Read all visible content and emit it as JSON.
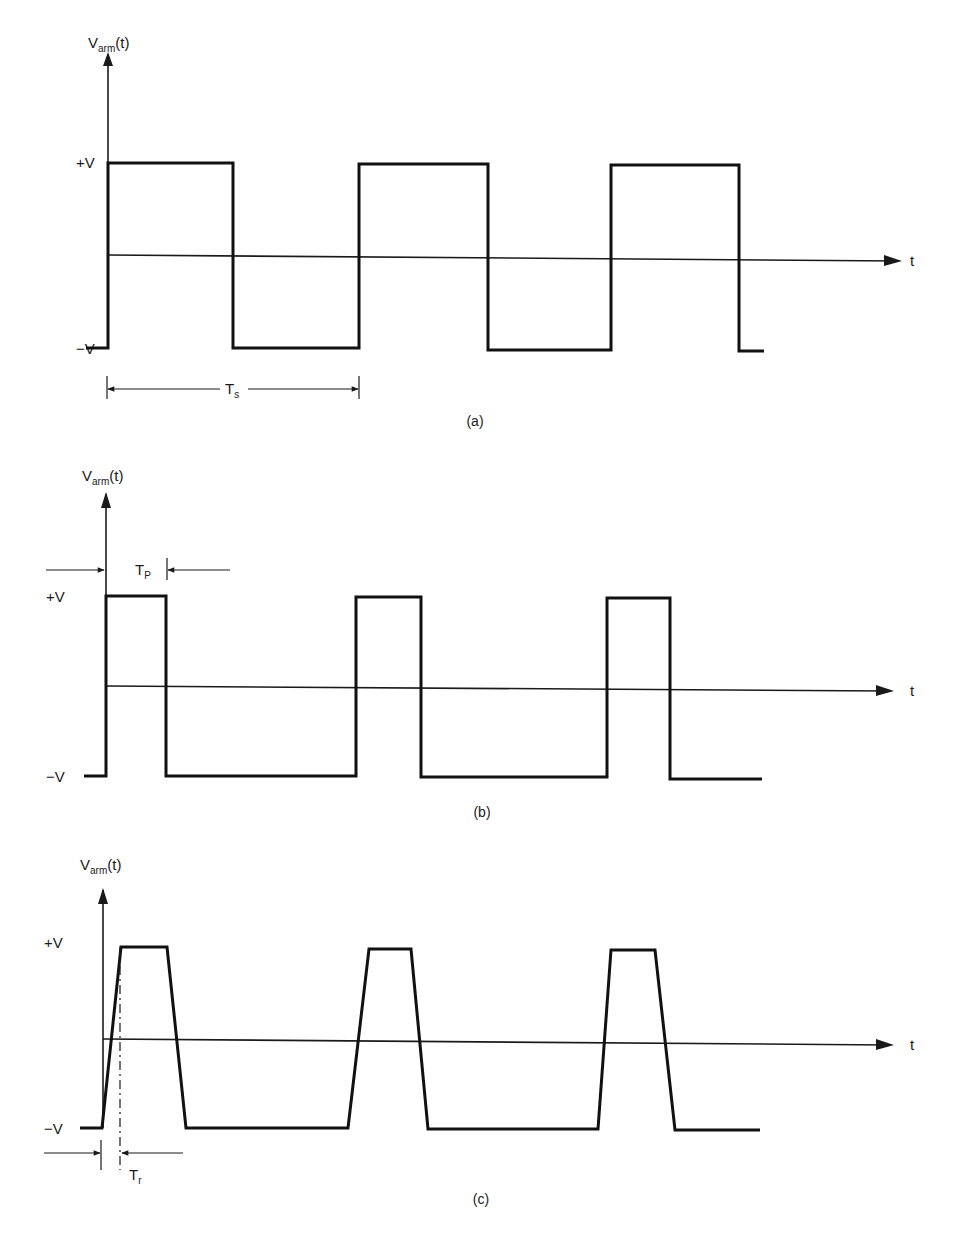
{
  "figure": {
    "panels": [
      {
        "id": "a",
        "caption": "(a)",
        "y_label_main": "V",
        "y_label_sub": "arm",
        "y_label_suffix": "(t)",
        "x_label": "t",
        "level_high": "+V",
        "level_low": "−V",
        "dimension": {
          "label_main": "T",
          "label_sub": "s",
          "meaning": "switching period"
        },
        "waveform": "square wave, 50% duty cycle, ideal edges"
      },
      {
        "id": "b",
        "caption": "(b)",
        "y_label_main": "V",
        "y_label_sub": "arm",
        "y_label_suffix": "(t)",
        "x_label": "t",
        "level_high": "+V",
        "level_low": "−V",
        "dimension": {
          "label_main": "T",
          "label_sub": "P",
          "meaning": "pulse width"
        },
        "waveform": "pulse wave, ~25% duty cycle, ideal edges"
      },
      {
        "id": "c",
        "caption": "(c)",
        "y_label_main": "V",
        "y_label_sub": "arm",
        "y_label_suffix": "(t)",
        "x_label": "t",
        "level_high": "+V",
        "level_low": "−V",
        "dimension": {
          "label_main": "T",
          "label_sub": "r",
          "meaning": "rise time"
        },
        "waveform": "trapezoidal pulse wave with finite rise/fall times"
      }
    ]
  }
}
